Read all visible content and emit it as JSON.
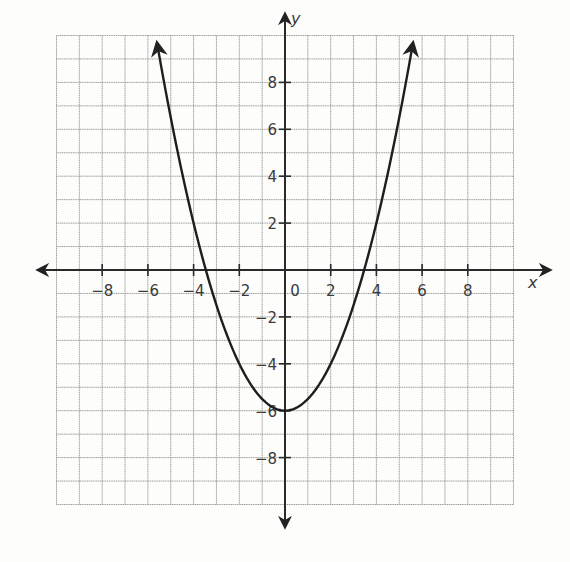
{
  "chart_data": {
    "type": "line",
    "title": "",
    "xlabel": "x",
    "ylabel": "y",
    "xlim": [
      -10,
      10
    ],
    "ylim": [
      -10,
      10
    ],
    "grid": true,
    "grid_step": 1,
    "x_ticks": [
      -8,
      -6,
      -4,
      -2,
      0,
      2,
      4,
      6,
      8
    ],
    "x_tick_labels": [
      "−8",
      "−6",
      "−4",
      "−2",
      "0",
      "2",
      "4",
      "6",
      "8"
    ],
    "y_ticks": [
      8,
      6,
      4,
      2,
      -2,
      -4,
      -6,
      -8
    ],
    "y_tick_labels": [
      "8",
      "6",
      "4",
      "2",
      "−2",
      "−4",
      "−6",
      "−8"
    ],
    "series": [
      {
        "name": "parabola",
        "equation": "y = 0.5x^2 - 6",
        "vertex": [
          0,
          -6
        ],
        "x_intercepts": [
          -3.5,
          3.5
        ],
        "y_intercept": -6,
        "x_range": [
          -5.6,
          5.6
        ],
        "arrows_at_ends": true,
        "points": [
          [
            -5.6,
            9.7
          ],
          [
            -5,
            6.5
          ],
          [
            -4,
            2
          ],
          [
            -3.5,
            0
          ],
          [
            -2,
            -4
          ],
          [
            0,
            -6
          ],
          [
            2,
            -4
          ],
          [
            3.5,
            0
          ],
          [
            4,
            2
          ],
          [
            5,
            6.5
          ],
          [
            5.6,
            9.7
          ]
        ]
      }
    ],
    "legend": null
  },
  "colors": {
    "grid": "#9a9a9a",
    "axis": "#2a2a2a",
    "curve": "#1e1e1e",
    "background": "#fdfdfb"
  }
}
